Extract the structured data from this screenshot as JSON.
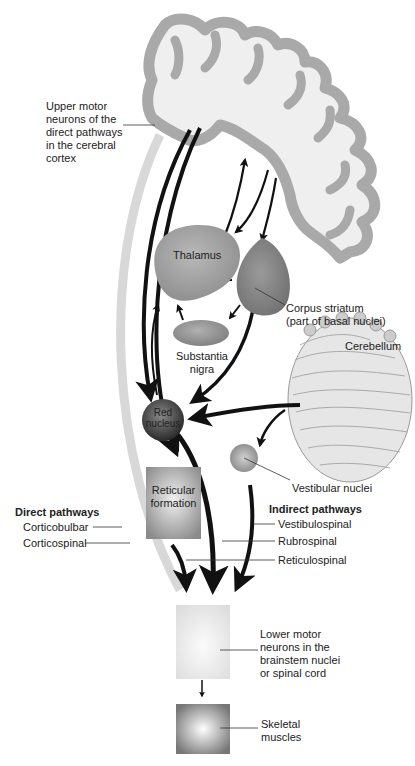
{
  "labels": {
    "upper_motor": "Upper motor\nneurons of the\ndirect pathways\nin the cerebral\ncortex",
    "thalamus": "Thalamus",
    "corpus_striatum": "Corpus striatum\n(part of basal nuclei)",
    "substantia_nigra": "Substantia\nnigra",
    "cerebellum": "Cerebellum",
    "red_nucleus": "Red\nnucleus",
    "reticular_formation": "Reticular\nformation",
    "vestibular_nuclei": "Vestibular nuclei",
    "lower_motor": "Lower motor\nneurons in the\nbrainstem nuclei\nor spinal cord",
    "skeletal_muscles": "Skeletal\nmuscles"
  },
  "direct_pathways": {
    "title": "Direct pathways",
    "items": [
      "Corticobulbar",
      "Corticospinal"
    ]
  },
  "indirect_pathways": {
    "title": "Indirect pathways",
    "items": [
      "Vestibulospinal",
      "Rubrospinal",
      "Reticulospinal"
    ]
  },
  "colors": {
    "cortex": "#a9a9a9",
    "structure": "#9a9a9a",
    "arrow": "#111111",
    "light_arrow": "#d8d8d8"
  }
}
